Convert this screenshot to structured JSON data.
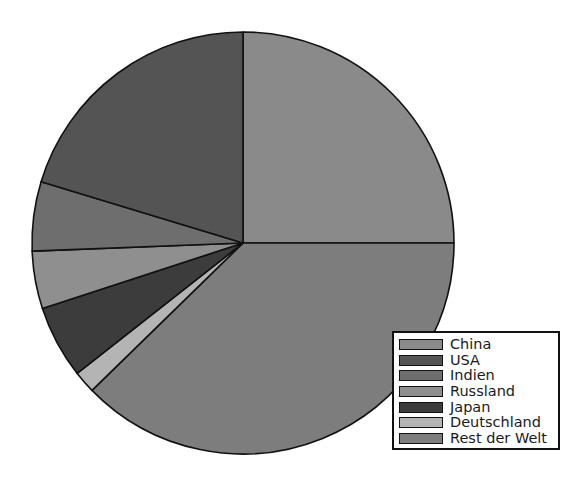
{
  "chart_data": {
    "type": "pie",
    "title": "",
    "subtitle": "",
    "xlabel": "",
    "ylabel": "",
    "legend_position": "bottom-right",
    "grid": false,
    "start_angle_deg": 0,
    "direction": "clockwise",
    "categories": [
      "China",
      "USA",
      "Indien",
      "Russland",
      "Japan",
      "Deutschland",
      "Rest der Welt"
    ],
    "values": [
      25.0,
      20.3,
      5.3,
      4.4,
      5.6,
      1.7,
      37.7
    ],
    "units": "percent",
    "slices": [
      {
        "label": "China",
        "value": 25.0,
        "color": "#8a8a8a",
        "start_deg": 0.0,
        "end_deg": 90.0
      },
      {
        "label": "Rest der Welt",
        "value": 37.7,
        "color": "#7d7d7d",
        "start_deg": 90.0,
        "end_deg": 225.7
      },
      {
        "label": "Deutschland",
        "value": 1.7,
        "color": "#b4b4b4",
        "start_deg": 225.7,
        "end_deg": 231.8
      },
      {
        "label": "Japan",
        "value": 5.6,
        "color": "#3c3c3c",
        "start_deg": 231.8,
        "end_deg": 251.9
      },
      {
        "label": "Russland",
        "value": 4.4,
        "color": "#8f8f8f",
        "start_deg": 251.9,
        "end_deg": 267.8
      },
      {
        "label": "Indien",
        "value": 5.3,
        "color": "#6e6e6e",
        "start_deg": 267.8,
        "end_deg": 286.9
      },
      {
        "label": "USA",
        "value": 20.3,
        "color": "#545454",
        "start_deg": 286.9,
        "end_deg": 360.0
      }
    ],
    "geometry": {
      "center_x": 243,
      "center_y": 243,
      "radius": 211,
      "outline_color": "#111111",
      "outline_width": 1.6
    }
  },
  "legend": {
    "items": [
      {
        "label": "China",
        "color": "#8a8a8a"
      },
      {
        "label": "USA",
        "color": "#545454"
      },
      {
        "label": "Indien",
        "color": "#6e6e6e"
      },
      {
        "label": "Russland",
        "color": "#8f8f8f"
      },
      {
        "label": "Japan",
        "color": "#3c3c3c"
      },
      {
        "label": "Deutschland",
        "color": "#b4b4b4"
      },
      {
        "label": "Rest der Welt",
        "color": "#7d7d7d"
      }
    ]
  }
}
